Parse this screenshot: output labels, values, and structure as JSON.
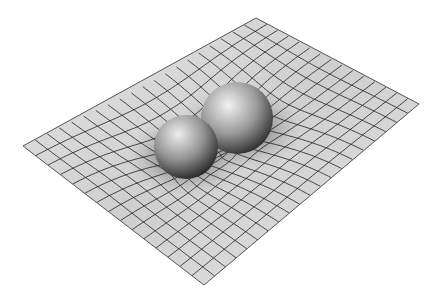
{
  "image": {
    "subject": "Two spheres deforming a gridded sheet (spacetime curvature illustration)",
    "width": 441,
    "height": 300,
    "background": "#ffffff"
  },
  "sheet": {
    "corners": {
      "left": [
        23,
        146
      ],
      "top": [
        256,
        18
      ],
      "right": [
        419,
        104
      ],
      "bottom": [
        204,
        285
      ]
    },
    "fill_light": "#e4e4e4",
    "fill_mid": "#cfcfcf",
    "fill_dark": "#8a8a8a",
    "edge_color": "#555555",
    "grid_color": "#1e1e1e",
    "grid_u_lines": 20,
    "grid_v_lines": 15
  },
  "wells": [
    {
      "name": "front-sphere-well",
      "center": [
        186,
        150
      ],
      "strength": 38,
      "radius": 95
    },
    {
      "name": "back-sphere-well",
      "center": [
        240,
        122
      ],
      "strength": 40,
      "radius": 100
    }
  ],
  "spheres": [
    {
      "name": "back-sphere",
      "center": [
        237,
        118
      ],
      "r": 36,
      "highlight": "#f2f2f2",
      "mid": "#9a9a9a",
      "shadow": "#2e2e2e"
    },
    {
      "name": "front-sphere",
      "center": [
        186,
        147
      ],
      "r": 32,
      "highlight": "#eeeeee",
      "mid": "#939393",
      "shadow": "#2a2a2a"
    }
  ]
}
